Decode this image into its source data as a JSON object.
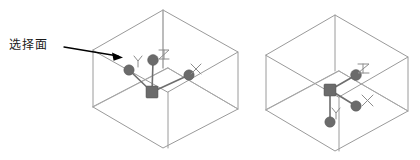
{
  "diagram": {
    "title": "选择面",
    "callout": {
      "label": "选择面",
      "name": "select-face-callout"
    },
    "colors": {
      "cube_edge": "#9a9a9a",
      "gizmo_marker": "#6b6b6b",
      "gizmo_arm": "#6e6e6e",
      "axis_glyph": "#8c8c8c",
      "callout": "#000000",
      "background": "#ffffff"
    },
    "shapes": [
      {
        "name": "left-cube",
        "label": "Left isometric cube with move gizmo on top face",
        "gizmo": {
          "center_label": "",
          "axes": [
            {
              "axis": "Y",
              "label": "Y",
              "direction": "upper-left"
            },
            {
              "axis": "Z",
              "label": "Z",
              "direction": "up"
            },
            {
              "axis": "X",
              "label": "X",
              "direction": "right"
            }
          ]
        }
      },
      {
        "name": "right-cube",
        "label": "Right isometric cube with move gizmo on bottom face",
        "gizmo": {
          "center_label": "",
          "axes": [
            {
              "axis": "Z",
              "label": "Z",
              "direction": "upper-right"
            },
            {
              "axis": "X",
              "label": "X",
              "direction": "lower-right"
            },
            {
              "axis": "Y",
              "label": "Y",
              "direction": "down"
            }
          ]
        }
      }
    ],
    "axis_labels": {
      "left_y": "Y",
      "left_z": "Z",
      "left_x": "X",
      "right_z": "Z",
      "right_x": "X",
      "right_y": "Y"
    }
  }
}
